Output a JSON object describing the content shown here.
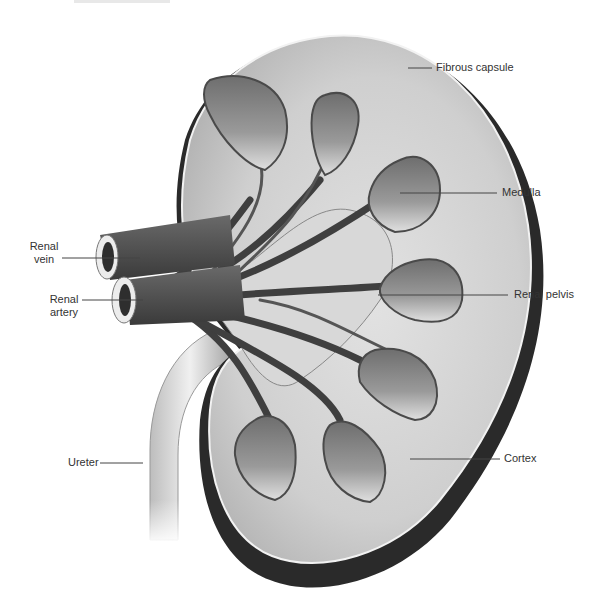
{
  "diagram": {
    "colors": {
      "background": "#ffffff",
      "cortex": "#c9c9c9",
      "medulla": "#8a8a8a",
      "vessels": "#4a4a4a",
      "capsule_shadow": "#2a2a2a",
      "label_text": "#333333",
      "leader_line": "#444444"
    },
    "labels": [
      {
        "id": "fibrous-capsule",
        "text": "Fibrous capsule"
      },
      {
        "id": "medulla",
        "text": "Medulla"
      },
      {
        "id": "renal-vein",
        "line1": "Renal",
        "line2": "vein"
      },
      {
        "id": "renal-artery",
        "line1": "Renal",
        "line2": "artery"
      },
      {
        "id": "renal-pelvis",
        "text": "Renal pelvis"
      },
      {
        "id": "ureter",
        "text": "Ureter"
      },
      {
        "id": "cortex",
        "text": "Cortex"
      }
    ]
  }
}
